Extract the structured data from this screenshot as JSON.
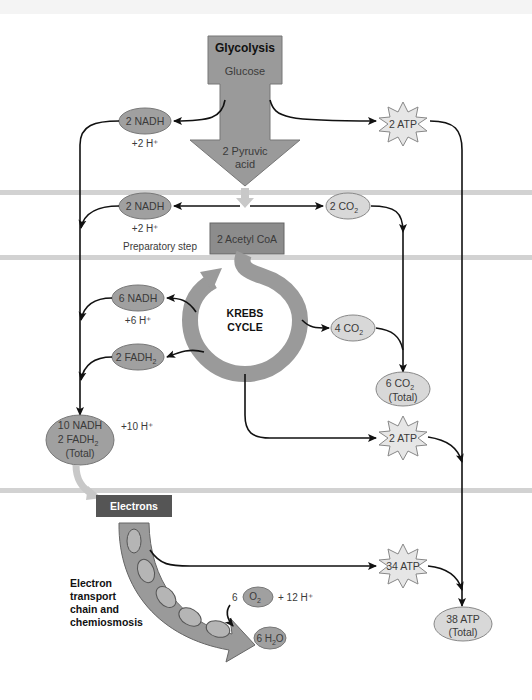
{
  "diagram": {
    "glycolysis": {
      "title": "Glycolysis",
      "substrate": "Glucose",
      "product_line1": "2 Pyruvic",
      "product_line2": "acid",
      "nadh": "2 NADH",
      "h_plus": "+2 H⁺",
      "atp": "2 ATP"
    },
    "preparatory": {
      "nadh": "2 NADH",
      "h_plus": "+2 H⁺",
      "label": "Preparatory step",
      "co2": "2 CO",
      "co2_sub": "2",
      "acetyl": "2 Acetyl CoA"
    },
    "krebs": {
      "line1": "KREBS",
      "line2": "CYCLE",
      "nadh": "6 NADH",
      "h_plus": "+6 H⁺",
      "fadh_main": "2 FADH",
      "fadh_sub": "2",
      "co2": "4 CO",
      "co2_sub": "2",
      "atp": "2 ATP"
    },
    "totals": {
      "nadh_line1": "10 NADH",
      "nadh_line2_main": "2 FADH",
      "nadh_line2_sub": "2",
      "nadh_line3": "(Total)",
      "h_plus": "+10 H⁺",
      "co2_line1_main": "6 CO",
      "co2_line1_sub": "2",
      "co2_line2": "(Total)",
      "atp_line1": "38 ATP",
      "atp_line2": "(Total)"
    },
    "etc": {
      "electrons": "Electrons",
      "label_line1": "Electron",
      "label_line2": "transport",
      "label_line3": "chain and",
      "label_line4": "chemiosmosis",
      "o2_coef": "6",
      "o2_main": "O",
      "o2_sub": "2",
      "h_plus": "+ 12 H⁺",
      "water_main": "6 H",
      "water_sub": "2",
      "water_end": "O",
      "atp": "34 ATP"
    },
    "colors": {
      "dark_box": "#8c8c8c",
      "arrow_fill": "#9a9a9a",
      "oval_dark": "#a0a0a0",
      "oval_light": "#d8d8d8",
      "star": "#e6e6e6",
      "membrane": "#d0d0d0",
      "electrons_box": "#555555"
    }
  }
}
